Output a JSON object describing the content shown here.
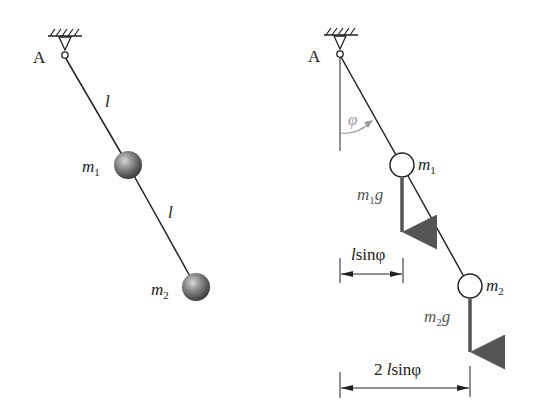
{
  "left_figure": {
    "pivot_label": "A",
    "segment1_label": "l",
    "segment2_label": "l",
    "mass1": {
      "symbol": "m",
      "subscript": "1"
    },
    "mass2": {
      "symbol": "m",
      "subscript": "2"
    }
  },
  "right_figure": {
    "pivot_label": "A",
    "angle_label": "φ",
    "mass1": {
      "symbol": "m",
      "subscript": "1"
    },
    "mass2": {
      "symbol": "m",
      "subscript": "2"
    },
    "force1": {
      "symbol": "m",
      "subscript": "1",
      "suffix": "g"
    },
    "force2": {
      "symbol": "m",
      "subscript": "2",
      "suffix": "g"
    },
    "dimension1": {
      "prefix": "",
      "l": "l",
      "rest": "sinφ"
    },
    "dimension2": {
      "prefix": "2 ",
      "l": "l",
      "rest": "sinφ"
    }
  },
  "colors": {
    "line": "#222222",
    "force_arrow": "#555555",
    "angle_arc": "#9a9a9a",
    "ball_fill": "#6e6e6e"
  }
}
